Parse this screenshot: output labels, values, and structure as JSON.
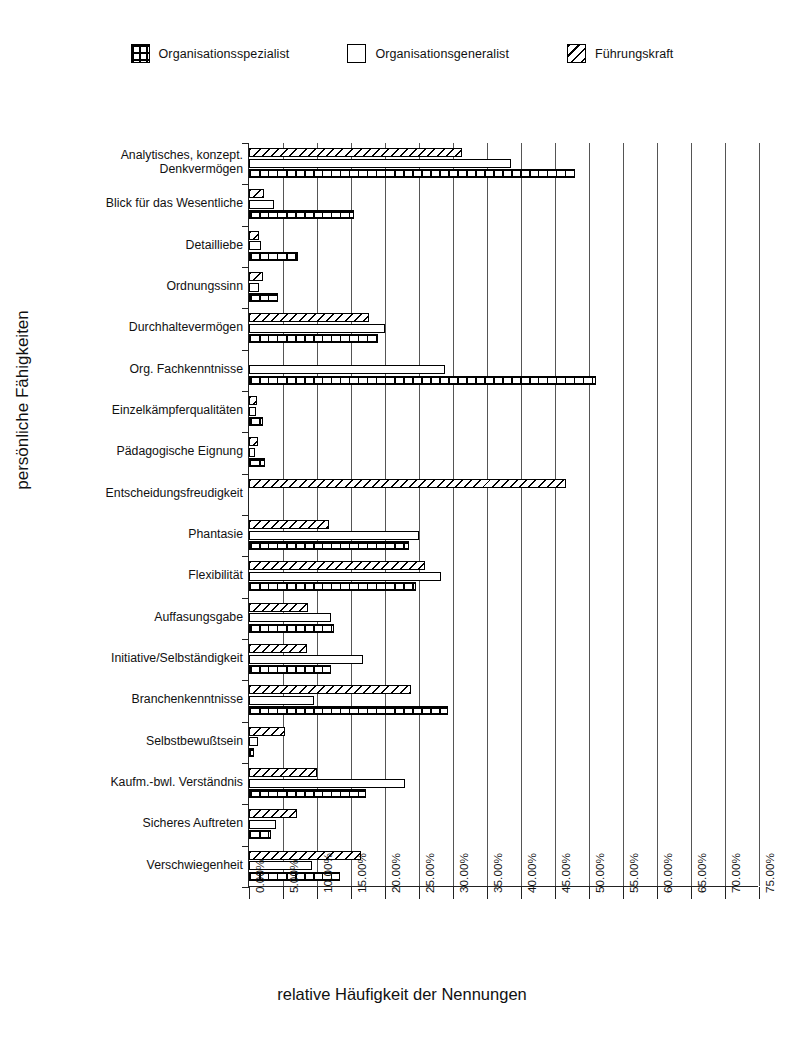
{
  "legend": {
    "items": [
      {
        "label": "Organisationsspezialist",
        "pattern": "grid",
        "icon": "grid-swatch-icon"
      },
      {
        "label": "Organisationsgeneralist",
        "pattern": "blank",
        "icon": "blank-swatch-icon"
      },
      {
        "label": "Führungskraft",
        "pattern": "diag",
        "icon": "diagonal-hatch-swatch-icon"
      }
    ]
  },
  "chart_data": {
    "type": "bar",
    "orientation": "horizontal",
    "title": "",
    "xlabel": "relative Häufigkeit der Nennungen",
    "ylabel": "persönliche Fähigkeiten",
    "xlim": [
      0,
      75
    ],
    "xunit": "%",
    "grid": "vertical",
    "legend_position": "top-center",
    "xticks": [
      "0.00%",
      "5.00%",
      "10.00%",
      "15.00%",
      "20.00%",
      "25.00%",
      "30.00%",
      "35.00%",
      "40.00%",
      "45.00%",
      "50.00%",
      "55.00%",
      "60.00%",
      "65.00%",
      "70.00%",
      "75.00%"
    ],
    "xtick_values": [
      0,
      5,
      10,
      15,
      20,
      25,
      30,
      35,
      40,
      45,
      50,
      55,
      60,
      65,
      70,
      75
    ],
    "categories": [
      "Analytisches, konzept.\nDenkvermögen",
      "Blick für das Wesentliche",
      "Detailliebe",
      "Ordnungssinn",
      "Durchhaltevermögen",
      "Org. Fachkenntnisse",
      "Einzelkämpferqualitäten",
      "Pädagogische Eignung",
      "Entscheidungsfreudigkeit",
      "Phantasie",
      "Flexibilität",
      "Auffasungsgabe",
      "Initiative/Selbständigkeit",
      "Branchenkenntnisse",
      "Selbstbewußtsein",
      "Kaufm.-bwl. Verständnis",
      "Sicheres Auftreten",
      "Verschwiegenheit"
    ],
    "series": [
      {
        "name": "Führungskraft",
        "pattern": "diag",
        "values": [
          31.3,
          2.2,
          1.5,
          2.0,
          17.6,
          0.0,
          1.2,
          1.3,
          46.6,
          11.8,
          25.9,
          8.7,
          8.5,
          23.8,
          5.3,
          10.0,
          7.0,
          16.5
        ]
      },
      {
        "name": "Organisationsgeneralist",
        "pattern": "blank",
        "values": [
          38.5,
          3.7,
          1.8,
          1.5,
          20.0,
          28.8,
          1.0,
          0.9,
          0.0,
          25.0,
          28.2,
          12.0,
          16.8,
          9.6,
          1.3,
          23.0,
          4.0,
          9.2
        ]
      },
      {
        "name": "Organisationsspezialist",
        "pattern": "grid",
        "values": [
          48.0,
          15.4,
          7.2,
          4.2,
          19.0,
          51.0,
          2.0,
          2.4,
          0.0,
          23.5,
          24.6,
          12.5,
          12.0,
          29.3,
          0.8,
          17.2,
          3.3,
          13.4
        ]
      }
    ]
  }
}
